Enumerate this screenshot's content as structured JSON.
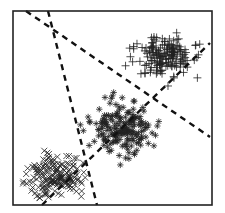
{
  "chart_data": {
    "type": "scatter",
    "title": "",
    "xlabel": "",
    "ylabel": "",
    "grid": false,
    "legend": null,
    "frame": {
      "x0": 13,
      "y0": 11,
      "x1": 212,
      "y1": 205
    },
    "boundaries": [
      {
        "name": "boundary-1",
        "x1": 26,
        "y1": 11,
        "x2": 210,
        "y2": 137
      },
      {
        "name": "boundary-2",
        "x1": 48,
        "y1": 11,
        "x2": 97,
        "y2": 205
      },
      {
        "name": "boundary-3",
        "x1": 42,
        "y1": 205,
        "x2": 210,
        "y2": 43
      }
    ],
    "series": [
      {
        "name": "cluster-plus",
        "marker": "+",
        "center": [
          165,
          56
        ],
        "spread": [
          14,
          11
        ],
        "count": 170,
        "size": 4,
        "seed": 11
      },
      {
        "name": "cluster-star",
        "marker": "*",
        "center": [
          121,
          128
        ],
        "spread": [
          15,
          12
        ],
        "count": 190,
        "size": 3.2,
        "seed": 23
      },
      {
        "name": "cluster-x",
        "marker": "x",
        "center": [
          54,
          177
        ],
        "spread": [
          13,
          11
        ],
        "count": 180,
        "size": 3,
        "seed": 37
      }
    ],
    "colors": {
      "marker": "#222222",
      "line": "#111111",
      "frame": "#222222",
      "background": "#ffffff"
    }
  }
}
